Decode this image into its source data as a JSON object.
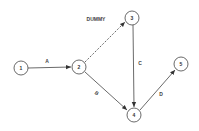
{
  "diagram": {
    "type": "activity-network",
    "nodes": [
      {
        "id": "1",
        "label": "1",
        "cx": 21,
        "cy": 68
      },
      {
        "id": "2",
        "label": "2",
        "cx": 79,
        "cy": 67
      },
      {
        "id": "3",
        "label": "3",
        "cx": 132,
        "cy": 18
      },
      {
        "id": "4",
        "label": "4",
        "cx": 134,
        "cy": 115
      },
      {
        "id": "5",
        "label": "5",
        "cx": 181,
        "cy": 64
      }
    ],
    "edges": [
      {
        "from": "1",
        "to": "2",
        "label": "A",
        "style": "solid"
      },
      {
        "from": "2",
        "to": "3",
        "label": "DUMMY",
        "style": "dashed"
      },
      {
        "from": "3",
        "to": "4",
        "label": "C",
        "style": "solid"
      },
      {
        "from": "2",
        "to": "4",
        "label": "B",
        "style": "solid"
      },
      {
        "from": "4",
        "to": "5",
        "label": "D",
        "style": "solid"
      }
    ]
  }
}
